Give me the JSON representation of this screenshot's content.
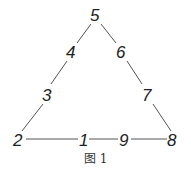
{
  "diagram": {
    "type": "number-triangle",
    "nodes": [
      {
        "label": "5",
        "x": 96,
        "y": 21
      },
      {
        "label": "4",
        "x": 71,
        "y": 58
      },
      {
        "label": "6",
        "x": 122,
        "y": 58
      },
      {
        "label": "3",
        "x": 47,
        "y": 101
      },
      {
        "label": "7",
        "x": 147,
        "y": 101
      },
      {
        "label": "2",
        "x": 19,
        "y": 146
      },
      {
        "label": "1",
        "x": 83,
        "y": 146
      },
      {
        "label": "9",
        "x": 124,
        "y": 146
      },
      {
        "label": "8",
        "x": 173,
        "y": 146
      }
    ],
    "caption": "图 1"
  }
}
